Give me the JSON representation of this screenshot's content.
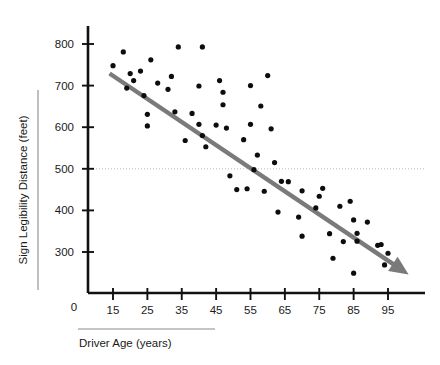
{
  "chart_data": {
    "type": "scatter",
    "title": "",
    "xlabel": "Driver Age (years)",
    "ylabel": "Sign Legibility Distance (feet)",
    "xlim": [
      10,
      103
    ],
    "ylim": [
      215,
      830
    ],
    "xticks": [
      15,
      25,
      35,
      45,
      55,
      65,
      75,
      85,
      95
    ],
    "xtick_labels": [
      "15",
      "25",
      "35",
      "45",
      "55",
      "65",
      "75",
      "85",
      "95"
    ],
    "yticks": [
      300,
      400,
      500,
      600,
      700,
      800
    ],
    "ytick_labels": [
      "300",
      "400",
      "500",
      "600",
      "700",
      "800"
    ],
    "origin_label": "0",
    "grid": "horizontal-reference-line-at-500",
    "gridlines": [
      500
    ],
    "legend": "none",
    "series": [
      {
        "name": "Driver observations",
        "marker": "filled-circle",
        "color": "#0d0d0d",
        "points": [
          [
            15,
            748
          ],
          [
            18,
            781
          ],
          [
            19,
            694
          ],
          [
            20,
            729
          ],
          [
            21,
            712
          ],
          [
            23,
            735
          ],
          [
            24,
            676
          ],
          [
            25,
            631
          ],
          [
            25,
            603
          ],
          [
            26,
            762
          ],
          [
            28,
            706
          ],
          [
            31,
            691
          ],
          [
            32,
            722
          ],
          [
            33,
            637
          ],
          [
            34,
            793
          ],
          [
            36,
            568
          ],
          [
            38,
            633
          ],
          [
            40,
            699
          ],
          [
            40,
            607
          ],
          [
            41,
            580
          ],
          [
            41,
            793
          ],
          [
            42,
            553
          ],
          [
            45,
            605
          ],
          [
            46,
            712
          ],
          [
            47,
            684
          ],
          [
            47,
            654
          ],
          [
            48,
            598
          ],
          [
            49,
            483
          ],
          [
            51,
            450
          ],
          [
            53,
            570
          ],
          [
            54,
            452
          ],
          [
            55,
            607
          ],
          [
            55,
            700
          ],
          [
            56,
            498
          ],
          [
            57,
            533
          ],
          [
            58,
            651
          ],
          [
            59,
            446
          ],
          [
            60,
            724
          ],
          [
            61,
            596
          ],
          [
            62,
            515
          ],
          [
            63,
            396
          ],
          [
            64,
            470
          ],
          [
            66,
            469
          ],
          [
            69,
            384
          ],
          [
            70,
            447
          ],
          [
            70,
            338
          ],
          [
            74,
            406
          ],
          [
            75,
            434
          ],
          [
            76,
            453
          ],
          [
            78,
            344
          ],
          [
            79,
            285
          ],
          [
            81,
            410
          ],
          [
            82,
            325
          ],
          [
            84,
            422
          ],
          [
            85,
            377
          ],
          [
            85,
            249
          ],
          [
            86,
            345
          ],
          [
            86,
            326
          ],
          [
            89,
            372
          ],
          [
            92,
            316
          ],
          [
            93,
            318
          ],
          [
            94,
            269
          ],
          [
            95,
            297
          ]
        ]
      }
    ],
    "trendline": {
      "name": "fitted-regression-line",
      "color": "#7a7a7a",
      "style": "solid-with-arrowhead",
      "start": [
        14,
        729
      ],
      "end": [
        101,
        246
      ],
      "arrow": "end"
    },
    "annotations": [
      {
        "name": "y-axis-sidebar-rule",
        "type": "vertical-rule"
      },
      {
        "name": "x-axis-underline-rule",
        "type": "horizontal-rule"
      }
    ]
  }
}
